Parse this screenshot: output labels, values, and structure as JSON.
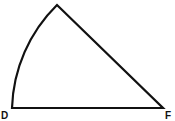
{
  "diagram": {
    "type": "sector",
    "stroke_color": "#111111",
    "background": "#ffffff",
    "vertices": {
      "apex": {
        "x": 57,
        "y": 5
      },
      "D": {
        "x": 12,
        "y": 108,
        "label": "D"
      },
      "F": {
        "x": 163,
        "y": 108,
        "label": "F"
      }
    },
    "labels": [
      "D",
      "F"
    ]
  }
}
